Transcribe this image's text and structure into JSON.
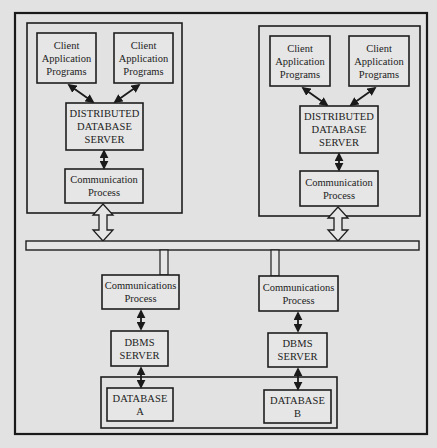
{
  "diagram": {
    "site_left": {
      "client_1": "Client\nApplication\nPrograms",
      "client_2": "Client\nApplication\nPrograms",
      "dds": "DISTRIBUTED\nDATABASE\nSERVER",
      "comm": "Communication\nProcess"
    },
    "site_right": {
      "client_1": "Client\nApplication\nPrograms",
      "client_2": "Client\nApplication\nPrograms",
      "dds": "DISTRIBUTED\nDATABASE\nSERVER",
      "comm": "Communication\nProcess"
    },
    "node_left": {
      "comm": "Communications\nProcess",
      "dbms": "DBMS\nSERVER",
      "database": "DATABASE\nA"
    },
    "node_right": {
      "comm": "Communications\nProcess",
      "dbms": "DBMS\nSERVER",
      "database": "DATABASE\nB"
    }
  }
}
